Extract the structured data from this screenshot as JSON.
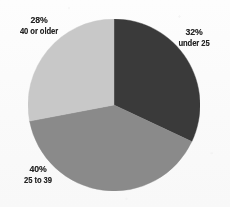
{
  "chart_data": {
    "type": "pie",
    "title": "",
    "subtitle": "",
    "xlabel": "",
    "ylabel": "",
    "legend_position": "none",
    "grid": false,
    "units": "percent",
    "start_angle_deg": 0,
    "direction": "clockwise",
    "categories": [
      "under 25",
      "25 to 39",
      "40 or older"
    ],
    "values": [
      32,
      40,
      28
    ],
    "slices": [
      {
        "label": "under 25",
        "value": 32,
        "value_text": "32%",
        "color": "#3a3a3a",
        "start_angle_deg": 0,
        "end_angle_deg": 115.2,
        "label_position": "right"
      },
      {
        "label": "25 to 39",
        "value": 40,
        "value_text": "40%",
        "color": "#8a8a8a",
        "start_angle_deg": 115.2,
        "end_angle_deg": 259.2,
        "label_position": "bottom-left"
      },
      {
        "label": "40 or older",
        "value": 28,
        "value_text": "28%",
        "color": "#c8c8c8",
        "start_angle_deg": 259.2,
        "end_angle_deg": 360,
        "label_position": "top-left"
      }
    ]
  },
  "labels": {
    "under25": {
      "pct": "32%",
      "cat": "under 25"
    },
    "age25to39": {
      "pct": "40%",
      "cat": "25 to 39"
    },
    "age40older": {
      "pct": "28%",
      "cat": "40 or older"
    }
  },
  "colors": {
    "slice_under25": "#3a3a3a",
    "slice_25to39": "#8a8a8a",
    "slice_40older": "#c8c8c8",
    "background": "#fdfdfd",
    "text": "#242424"
  }
}
